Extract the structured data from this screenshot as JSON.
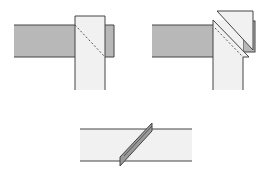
{
  "diagram": {
    "title": "",
    "colors": {
      "strip_gray": "#b8b8b8",
      "strip_light": "#f1f1f1",
      "outline": "#444444",
      "fold_line": "#555555"
    },
    "figures": [
      {
        "id": "step-1",
        "label": "",
        "caption": "Vertical strip laid over horizontal strip, dashed diagonal fold line"
      },
      {
        "id": "step-2",
        "label": "",
        "caption": "Corner folded back along diagonal"
      },
      {
        "id": "step-3",
        "label": "",
        "caption": "Finished strip with diagonal seam"
      }
    ]
  }
}
